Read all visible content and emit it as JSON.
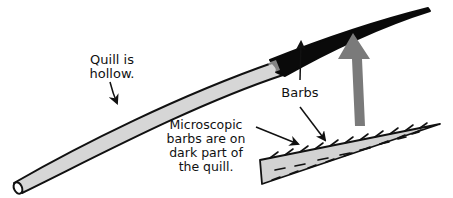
{
  "diagram": {
    "labels": {
      "hollow": [
        "Quill is",
        "hollow."
      ],
      "barbs": "Barbs",
      "microscopic": [
        "Microscopic",
        "barbs are on",
        "dark part of",
        "the quill."
      ]
    },
    "parts": {
      "quill_shaft": "light gray hollow shaft",
      "quill_tip": "dark barbed tip",
      "magnified_tip": "magnified view of barbed tip",
      "magnify_arrow": "gray arrow pointing from magnified view to tip"
    },
    "colors": {
      "shaft_fill": "#d6d6d6",
      "outline": "#111111",
      "tip": "#0a0a0a",
      "magnify_arrow": "#7a7a7a",
      "text": "#111111"
    }
  }
}
